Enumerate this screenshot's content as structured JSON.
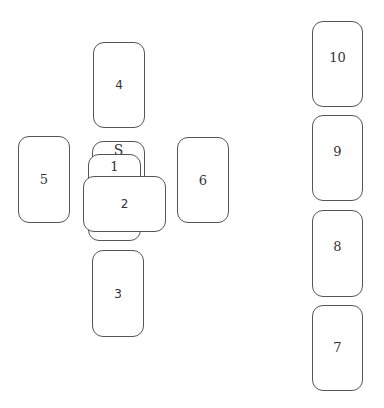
{
  "diagram": {
    "type": "tarot-spread",
    "layout_name": "Celtic Cross",
    "cards": [
      {
        "id": "S",
        "label": "S",
        "position": "significator",
        "x": 92,
        "y": 141,
        "w": 53,
        "h": 86
      },
      {
        "id": "1",
        "label": "1",
        "position": "center-cover",
        "x": 88,
        "y": 154,
        "w": 53,
        "h": 87
      },
      {
        "id": "2",
        "label": "2",
        "position": "center-crossing",
        "x": 83,
        "y": 176,
        "w": 83,
        "h": 56
      },
      {
        "id": "3",
        "label": "3",
        "position": "below",
        "x": 92,
        "y": 250,
        "w": 52,
        "h": 87
      },
      {
        "id": "4",
        "label": "4",
        "position": "above",
        "x": 93,
        "y": 42,
        "w": 52,
        "h": 86
      },
      {
        "id": "5",
        "label": "5",
        "position": "left",
        "x": 18,
        "y": 136,
        "w": 52,
        "h": 87
      },
      {
        "id": "6",
        "label": "6",
        "position": "right",
        "x": 177,
        "y": 137,
        "w": 52,
        "h": 86
      },
      {
        "id": "7",
        "label": "7",
        "position": "staff-1",
        "x": 312,
        "y": 305,
        "w": 51,
        "h": 86
      },
      {
        "id": "8",
        "label": "8",
        "position": "staff-2",
        "x": 312,
        "y": 210,
        "w": 51,
        "h": 87
      },
      {
        "id": "9",
        "label": "9",
        "position": "staff-3",
        "x": 312,
        "y": 115,
        "w": 51,
        "h": 86
      },
      {
        "id": "10",
        "label": "10",
        "position": "staff-4",
        "x": 312,
        "y": 21,
        "w": 51,
        "h": 86
      }
    ],
    "colors": {
      "border": "#555555",
      "text": "#333333",
      "background": "#ffffff"
    }
  }
}
